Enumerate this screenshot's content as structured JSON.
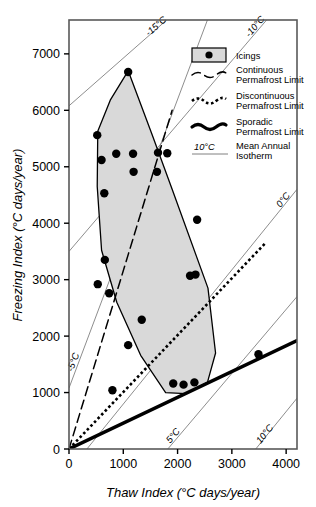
{
  "chart_data": {
    "type": "scatter",
    "title": "",
    "xlabel": "Thaw Index (°C days/year)",
    "ylabel": "Freezing Index (°C days/year)",
    "xlim": [
      0,
      4200
    ],
    "ylim": [
      0,
      7600
    ],
    "xticks": [
      0,
      1000,
      2000,
      3000,
      4000
    ],
    "xtick_labels": [
      "0",
      "1000",
      "2000",
      "3000",
      "4000"
    ],
    "yticks": [
      0,
      1000,
      2000,
      3000,
      4000,
      5000,
      6000,
      7000
    ],
    "ytick_labels": [
      "0",
      "1000",
      "2000",
      "3000",
      "4000",
      "5000",
      "6000",
      "7000"
    ],
    "grid": false,
    "legend_position": "top-right",
    "series": [
      {
        "name": "Icings",
        "type": "scatter",
        "marker": "filled-circle",
        "color": "#000000",
        "points": [
          [
            1090,
            6680
          ],
          [
            520,
            5560
          ],
          [
            600,
            5120
          ],
          [
            870,
            5230
          ],
          [
            1180,
            5230
          ],
          [
            1640,
            5250
          ],
          [
            1810,
            5240
          ],
          [
            1190,
            4910
          ],
          [
            1620,
            4910
          ],
          [
            650,
            4530
          ],
          [
            2360,
            4060
          ],
          [
            660,
            3350
          ],
          [
            2230,
            3070
          ],
          [
            2330,
            3090
          ],
          [
            530,
            2920
          ],
          [
            740,
            2760
          ],
          [
            1340,
            2290
          ],
          [
            1090,
            1840
          ],
          [
            3490,
            1680
          ],
          [
            1920,
            1160
          ],
          [
            2110,
            1140
          ],
          [
            2310,
            1180
          ],
          [
            800,
            1040
          ]
        ]
      }
    ],
    "shaded_region": {
      "name": "Icings envelope",
      "fill": "#d9d9d9",
      "stroke": "#000000",
      "vertices": [
        [
          1090,
          6700
        ],
        [
          1530,
          5570
        ],
        [
          1900,
          4600
        ],
        [
          2560,
          2850
        ],
        [
          2700,
          1700
        ],
        [
          2550,
          1180
        ],
        [
          2150,
          980
        ],
        [
          1780,
          1000
        ],
        [
          1320,
          1660
        ],
        [
          880,
          2600
        ],
        [
          600,
          3520
        ],
        [
          520,
          4650
        ],
        [
          530,
          5630
        ],
        [
          760,
          6180
        ]
      ]
    },
    "reference_lines": [
      {
        "name": "Continuous Permafrost Limit",
        "style": "long-dash",
        "from": [
          0,
          0
        ],
        "to": [
          1900,
          6000
        ]
      },
      {
        "name": "Discontinuous Permafrost Limit",
        "style": "dotted",
        "from": [
          0,
          0
        ],
        "to": [
          3620,
          3650
        ]
      },
      {
        "name": "Sporadic Permafrost Limit",
        "style": "thick-solid",
        "from": [
          0,
          0
        ],
        "to": [
          4200,
          1920
        ]
      }
    ],
    "isotherms": [
      {
        "label": "-15°C",
        "from": [
          0,
          6080
        ],
        "to": [
          1800,
          7600
        ],
        "label_at": [
          1640,
          7450
        ]
      },
      {
        "label": "-10°C",
        "from": [
          0,
          3500
        ],
        "to": [
          3640,
          7600
        ],
        "label_at": [
          3470,
          7450
        ]
      },
      {
        "label": "-5°C",
        "from": [
          0,
          1080
        ],
        "to": [
          2550,
          7600
        ],
        "label_at": [
          130,
          1520
        ]
      },
      {
        "label": "0°C",
        "from": [
          330,
          0
        ],
        "to": [
          4200,
          4600
        ],
        "label_at": [
          3990,
          4380
        ]
      },
      {
        "label": "5°C",
        "from": [
          1820,
          0
        ],
        "to": [
          4200,
          2700
        ],
        "label_at": [
          1960,
          200
        ]
      },
      {
        "label": "10°C",
        "from": [
          3440,
          0
        ],
        "to": [
          4200,
          900
        ],
        "label_at": [
          3650,
          230
        ]
      }
    ],
    "legend": {
      "items": [
        {
          "label": "Icings",
          "symbol": "filled-circle-box"
        },
        {
          "label": "Continuous\nPermafrost Limit",
          "line1": "Continuous",
          "line2": "Permafrost Limit",
          "symbol": "long-dash-wave"
        },
        {
          "label": "Discontinuous\nPermafrost Limit",
          "line1": "Discontinuous",
          "line2": "Permafrost Limit",
          "symbol": "dotted-wave"
        },
        {
          "label": "Sporadic\nPermafrost Limit",
          "line1": "Sporadic",
          "line2": "Permafrost Limit",
          "symbol": "thick-wave"
        },
        {
          "label": "Mean Annual\nIsotherm",
          "line1": "Mean Annual",
          "line2": "Isotherm",
          "symbol": "thin-line",
          "prefix": "10°C"
        }
      ]
    },
    "colors": {
      "shade_fill": "#d9d9d9",
      "line": "#000000",
      "isotherm": "#808080",
      "frame": "#595959"
    }
  }
}
